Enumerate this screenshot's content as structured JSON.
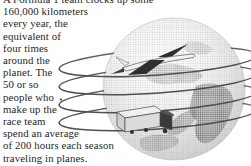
{
  "article": {
    "lines": [
      "A Formula 1 team clocks up some",
      "160,000 kilometers",
      "every year, the",
      "equivalent of",
      "four times",
      "around the",
      "planet. The",
      "50 or so",
      "people who",
      "make up the",
      "race team",
      "spend an average",
      "of 200 hours each season",
      "traveling in planes."
    ]
  },
  "illustration": {
    "description_elements": [
      "globe",
      "coil-rings",
      "airplane",
      "truck"
    ],
    "colors": {
      "text": "#1f1f1f",
      "ring_stroke": "#4f4f4f",
      "globe_edge": "#c4c4c4",
      "globe_highlight": "#ffffff",
      "halftone_dot": "#a8a8a8",
      "continent_dot": "#6e6e6e",
      "plane_wing": "#2f2f2f",
      "plane_body": "#f2f2f2",
      "truck_body": "#dcdcdc",
      "truck_cab": "#3a3a3a"
    }
  }
}
